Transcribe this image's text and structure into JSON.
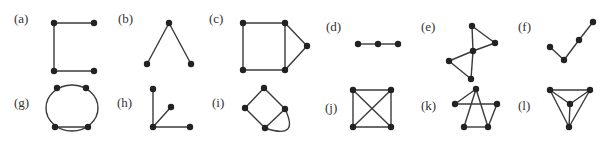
{
  "figure": {
    "colors": {
      "edge": "#3a3a3a",
      "vertex": "#222222",
      "label": "#333333",
      "background": "#ffffff"
    },
    "vertex_radius": 3.2,
    "graphs": [
      {
        "id": "a",
        "label": "(a)",
        "label_pos": [
          14,
          23
        ],
        "vertices": [
          [
            54,
            23
          ],
          [
            94,
            23
          ],
          [
            54,
            71
          ],
          [
            94,
            71
          ]
        ],
        "edges": [
          [
            0,
            1
          ],
          [
            0,
            2
          ],
          [
            2,
            3
          ]
        ]
      },
      {
        "id": "b",
        "label": "(b)",
        "label_pos": [
          118,
          23
        ],
        "vertices": [
          [
            169,
            23
          ],
          [
            147,
            64
          ],
          [
            191,
            64
          ]
        ],
        "edges": [
          [
            0,
            1
          ],
          [
            0,
            2
          ]
        ]
      },
      {
        "id": "c",
        "label": "(c)",
        "label_pos": [
          209,
          23
        ],
        "vertices": [
          [
            243,
            23
          ],
          [
            285,
            23
          ],
          [
            243,
            70
          ],
          [
            285,
            70
          ],
          [
            307,
            46
          ]
        ],
        "edges": [
          [
            0,
            1
          ],
          [
            0,
            2
          ],
          [
            2,
            3
          ],
          [
            1,
            3
          ],
          [
            1,
            4
          ],
          [
            3,
            4
          ]
        ]
      },
      {
        "id": "d",
        "label": "(d)",
        "label_pos": [
          326,
          31
        ],
        "vertices": [
          [
            358,
            44
          ],
          [
            378,
            44
          ],
          [
            398,
            44
          ]
        ],
        "edges": [
          [
            0,
            1
          ],
          [
            1,
            2
          ]
        ]
      },
      {
        "id": "e",
        "label": "(e)",
        "label_pos": [
          421,
          31
        ],
        "vertices": [
          [
            472,
            26
          ],
          [
            495,
            43
          ],
          [
            473,
            51
          ],
          [
            449,
            61
          ],
          [
            471,
            79
          ]
        ],
        "edges": [
          [
            0,
            1
          ],
          [
            0,
            2
          ],
          [
            2,
            1
          ],
          [
            2,
            3
          ],
          [
            2,
            4
          ],
          [
            3,
            4
          ]
        ]
      },
      {
        "id": "f",
        "label": "(f)",
        "label_pos": [
          518,
          31
        ],
        "vertices": [
          [
            550,
            47
          ],
          [
            564,
            60
          ],
          [
            579,
            40
          ],
          [
            593,
            22
          ]
        ],
        "edges": [
          [
            0,
            1
          ],
          [
            1,
            2
          ],
          [
            2,
            3
          ]
        ]
      },
      {
        "id": "g",
        "label": "(g)",
        "label_pos": [
          14,
          107
        ],
        "vertices": [
          [
            57,
            88
          ],
          [
            86,
            88
          ],
          [
            55,
            127
          ],
          [
            88,
            127
          ]
        ],
        "edges": [
          [
            2,
            3
          ]
        ],
        "circle": {
          "cx": 72,
          "cy": 108,
          "rx": 26,
          "ry": 23
        }
      },
      {
        "id": "h",
        "label": "(h)",
        "label_pos": [
          117,
          107
        ],
        "vertices": [
          [
            153,
            89
          ],
          [
            171,
            107
          ],
          [
            153,
            127
          ],
          [
            190,
            127
          ]
        ],
        "edges": [
          [
            0,
            2
          ],
          [
            1,
            2
          ],
          [
            2,
            3
          ]
        ]
      },
      {
        "id": "i",
        "label": "(i)",
        "label_pos": [
          212,
          107
        ],
        "vertices": [
          [
            264,
            88
          ],
          [
            245,
            108
          ],
          [
            285,
            109
          ],
          [
            265,
            128
          ]
        ],
        "edges": [
          [
            0,
            1
          ],
          [
            0,
            2
          ],
          [
            1,
            3
          ],
          [
            2,
            3
          ]
        ],
        "curves": [
          {
            "from": 2,
            "to": 3,
            "ctrl": [
              300,
              140
            ]
          }
        ]
      },
      {
        "id": "j",
        "label": "(j)",
        "label_pos": [
          325,
          112
        ],
        "vertices": [
          [
            353,
            90
          ],
          [
            391,
            90
          ],
          [
            353,
            127
          ],
          [
            391,
            127
          ]
        ],
        "edges": [
          [
            0,
            1
          ],
          [
            0,
            2
          ],
          [
            1,
            3
          ],
          [
            2,
            3
          ],
          [
            0,
            3
          ],
          [
            1,
            2
          ]
        ]
      },
      {
        "id": "k",
        "label": "(k)",
        "label_pos": [
          421,
          110
        ],
        "vertices": [
          [
            476,
            89
          ],
          [
            455,
            104
          ],
          [
            497,
            104
          ],
          [
            464,
            127
          ],
          [
            488,
            127
          ]
        ],
        "edges": [
          [
            0,
            1
          ],
          [
            1,
            2
          ],
          [
            0,
            3
          ],
          [
            0,
            4
          ],
          [
            2,
            4
          ],
          [
            3,
            4
          ]
        ]
      },
      {
        "id": "l",
        "label": "(l)",
        "label_pos": [
          518,
          110
        ],
        "vertices": [
          [
            550,
            90
          ],
          [
            590,
            90
          ],
          [
            570,
            104
          ],
          [
            569,
            127
          ]
        ],
        "edges": [
          [
            0,
            1
          ],
          [
            0,
            2
          ],
          [
            1,
            2
          ],
          [
            0,
            3
          ],
          [
            1,
            3
          ],
          [
            2,
            3
          ]
        ]
      }
    ]
  }
}
